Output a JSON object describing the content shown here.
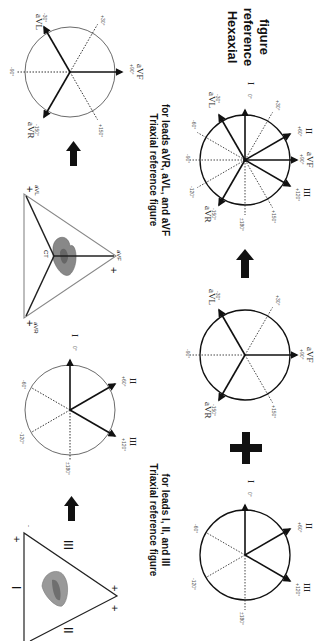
{
  "figure": {
    "orientation": "rotated 90 degrees clockwise",
    "panels": {
      "einthoven_triangle": {
        "side_labels": [
          "I",
          "II",
          "III"
        ],
        "polarity_marks": [
          "+",
          "+",
          "+",
          "-",
          "-"
        ]
      },
      "triaxial_I_II_III": {
        "title_line1": "Triaxial reference figure",
        "title_line2": "for leads I, II, and III",
        "leads": [
          {
            "name": "I",
            "angle_label": "0°"
          },
          {
            "name": "II",
            "angle_label": "+60°"
          },
          {
            "name": "III",
            "angle_label": "+120°"
          }
        ],
        "dotted_labels": [
          "-60°",
          "-120°",
          "±180°"
        ]
      },
      "augmented_triangle": {
        "center_label": "CT",
        "vertex_labels": [
          "aVR",
          "aVL",
          "aVF"
        ],
        "polarity_marks": [
          "+",
          "+",
          "+"
        ]
      },
      "triaxial_aVR_aVL_aVF": {
        "title_line1": "Triaxial reference figure",
        "title_line2": "for leads aVR, aVL, and aVF",
        "leads": [
          {
            "name": "aVL",
            "angle_label": "-30°"
          },
          {
            "name": "aVF",
            "angle_label": "+90°"
          },
          {
            "name": "aVR",
            "angle_label": "-150°"
          }
        ],
        "dotted_labels": [
          "+30°",
          "-90°",
          "+150°"
        ]
      },
      "hexaxial": {
        "title_line1": "Hexaxial",
        "title_line2": "reference",
        "title_line3": "figure",
        "leads": [
          {
            "name": "I",
            "angle_label": "0°"
          },
          {
            "name": "II",
            "angle_label": "+60°"
          },
          {
            "name": "aVF",
            "angle_label": "+90°"
          },
          {
            "name": "III",
            "angle_label": "+120°"
          },
          {
            "name": "aVR",
            "angle_label": "-150°"
          },
          {
            "name": "aVL",
            "angle_label": "-30°"
          }
        ],
        "dotted_labels": [
          "+30°",
          "-60°",
          "-90°",
          "-120°",
          "+150°",
          "±180°"
        ]
      }
    },
    "connectors": {
      "plus_symbol": "+",
      "arrow_count": 4
    }
  }
}
